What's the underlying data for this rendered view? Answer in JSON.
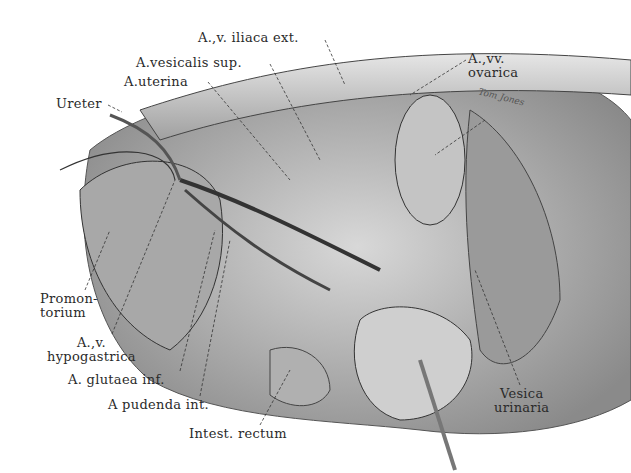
{
  "figure": {
    "type": "anatomical illustration",
    "signature": "Tom Jones",
    "labels": [
      {
        "id": "iliaca-ext",
        "text": "A.,v. iliaca ext.",
        "x": 198,
        "y": 31
      },
      {
        "id": "vesicalis-sup",
        "text": "A.vesicalis sup.",
        "x": 136,
        "y": 56
      },
      {
        "id": "uterina",
        "text": "A.uterina",
        "x": 124,
        "y": 75
      },
      {
        "id": "ureter",
        "text": "Ureter",
        "x": 56,
        "y": 97
      },
      {
        "id": "ovarica",
        "text": "A.,vv.\novarica",
        "x": 468,
        "y": 52
      },
      {
        "id": "promontorium",
        "text": "Promon-\ntorium",
        "x": 40,
        "y": 292
      },
      {
        "id": "hypogastrica",
        "text": "A.,v.\nhypogastrica",
        "x": 47,
        "y": 336
      },
      {
        "id": "glutaea-inf",
        "text": "A. glutaea inf.",
        "x": 68,
        "y": 373
      },
      {
        "id": "pudenda-int",
        "text": "A pudenda int.",
        "x": 108,
        "y": 398
      },
      {
        "id": "intest-rectum",
        "text": "Intest. rectum",
        "x": 189,
        "y": 427
      },
      {
        "id": "vesica-urinaria",
        "text": "Vesica\nurinaria",
        "x": 494,
        "y": 387
      }
    ]
  }
}
